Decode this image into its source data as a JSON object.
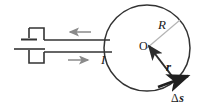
{
  "figure": {
    "background_color": "#ffffff",
    "width": 206,
    "height": 108,
    "colors": {
      "wire": "#333333",
      "arrow_gray": "#8a8a8a",
      "radius_line": "#b4b4b4",
      "vector": "#2b2b2b",
      "text": "#1a1a1a"
    }
  },
  "labels": {
    "radius": "R",
    "center": "O",
    "position_vector": "r",
    "current": "I",
    "path_element": "Δs"
  },
  "elements": {
    "battery": {
      "name": "battery",
      "long_plate_label": "",
      "short_plate_label": ""
    },
    "loop": {
      "center_x": 147,
      "center_y": 48,
      "radius": 43
    },
    "current_arrows": [
      {
        "name": "top-wire-current-arrow",
        "direction": "left"
      },
      {
        "name": "bottom-wire-current-arrow",
        "direction": "right"
      }
    ]
  }
}
